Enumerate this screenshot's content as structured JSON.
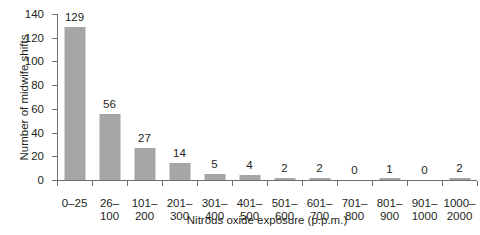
{
  "chart_data": {
    "type": "bar",
    "title": "",
    "xlabel": "Nitrous oxide exposure (p.p.m.)",
    "ylabel": "Number of midwife shifts",
    "categories": [
      "0–25",
      "26–\n100",
      "101–\n200",
      "201–\n300",
      "301–\n400",
      "401–\n500",
      "501–\n600",
      "601–\n700",
      "701–\n800",
      "801–\n900",
      "901–\n1000",
      "1000–\n2000"
    ],
    "values": [
      129,
      56,
      27,
      14,
      5,
      4,
      2,
      2,
      0,
      1,
      0,
      2
    ],
    "value_labels": [
      "129",
      "56",
      "27",
      "14",
      "5",
      "4",
      "2",
      "2",
      "0",
      "1",
      "0",
      "2"
    ],
    "ylim": [
      0,
      140
    ],
    "yticks": [
      0,
      20,
      40,
      60,
      80,
      100,
      120,
      140
    ],
    "ytick_labels": [
      "0",
      "20",
      "40",
      "60",
      "80",
      "100",
      "120",
      "140"
    ],
    "grid": false,
    "legend": null,
    "bar_color": "#a6a6a6",
    "axis_color": "#6f6f6f",
    "text_color": "#231f20",
    "background": "#ffffff"
  }
}
